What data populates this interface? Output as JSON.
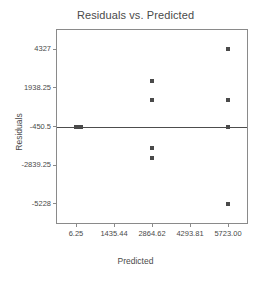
{
  "chart_data": {
    "type": "scatter",
    "title": "Residuals vs. Predicted",
    "xlabel": "Predicted",
    "ylabel": "Residuals",
    "xlim": [
      -708.4,
      6437.6
    ],
    "ylim": [
      -6422.4,
      5521.4
    ],
    "grid": false,
    "legend": null,
    "xticks": [
      6.25,
      1435.44,
      2864.62,
      4293.81,
      5723.0
    ],
    "xtick_labels": [
      "6.25",
      "1435.44",
      "2864.62",
      "4293.81",
      "5723.00"
    ],
    "yticks": [
      4327,
      1938.25,
      -450.5,
      -2839.25,
      -5228
    ],
    "ytick_labels": [
      "4327",
      "1938.25",
      "-450.5",
      "-2839.25",
      "-5228"
    ],
    "reference_line": {
      "orientation": "horizontal",
      "y": -450.5
    },
    "marker": "square",
    "marker_color": "#4a4a4a",
    "points": [
      {
        "x": 6.25,
        "y": -450.5
      },
      {
        "x": 6.25,
        "y": -450.5
      },
      {
        "x": 90.0,
        "y": -450.5
      },
      {
        "x": 150.0,
        "y": -450.5
      },
      {
        "x": 210.0,
        "y": -450.5
      },
      {
        "x": 2864.62,
        "y": 2350.0
      },
      {
        "x": 2864.62,
        "y": 1180.0
      },
      {
        "x": 2864.62,
        "y": -1800.0
      },
      {
        "x": 2864.62,
        "y": -2420.0
      },
      {
        "x": 5723.0,
        "y": 4327.0
      },
      {
        "x": 5723.0,
        "y": 1180.0
      },
      {
        "x": 5723.0,
        "y": -450.5
      },
      {
        "x": 5723.0,
        "y": -5228.0
      }
    ]
  }
}
